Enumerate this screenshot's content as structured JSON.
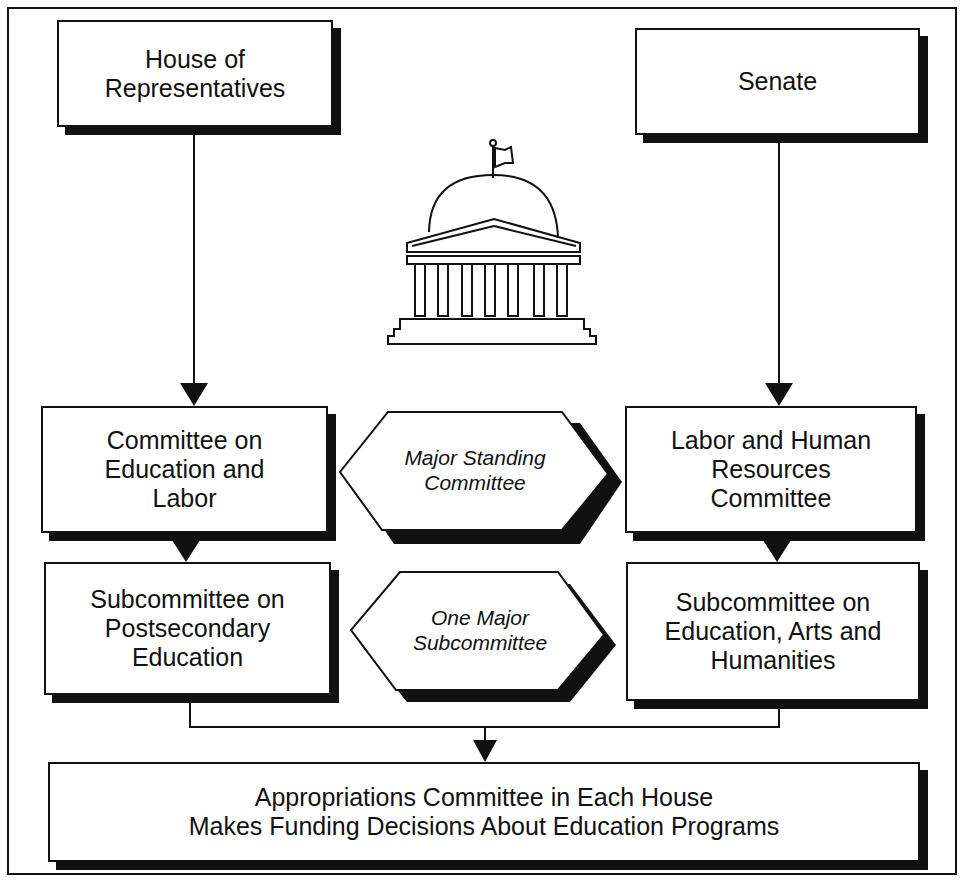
{
  "diagram": {
    "house": {
      "label": "House of\nRepresentatives"
    },
    "senate": {
      "label": "Senate"
    },
    "house_committee": {
      "label": "Committee on\nEducation and\nLabor"
    },
    "senate_committee": {
      "label": "Labor and Human\nResources\nCommittee"
    },
    "house_subcommittee": {
      "label": "Subcommittee on\nPostsecondary\nEducation"
    },
    "senate_subcommittee": {
      "label": "Subcommittee on\nEducation, Arts and\nHumanities"
    },
    "standing_label": {
      "label": "Major Standing\nCommittee"
    },
    "subcommittee_label": {
      "label": "One Major\nSubcommittee"
    },
    "appropriations": {
      "label": "Appropriations Committee in Each House\nMakes Funding Decisions About Education Programs"
    },
    "icon": "capitol-building-icon"
  }
}
